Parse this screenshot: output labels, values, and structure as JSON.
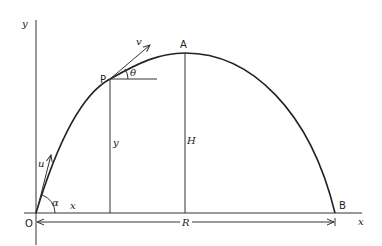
{
  "diagram": {
    "type": "projectile-trajectory",
    "labels": {
      "y_axis": "y",
      "x_axis": "x",
      "origin": "O",
      "apex": "A",
      "landing": "B",
      "point": "P",
      "velocity": "v",
      "angle_at_p": "θ",
      "initial_velocity": "u",
      "launch_angle": "α",
      "horizontal_displacement": "x",
      "vertical_displacement": "y",
      "max_height": "H",
      "range": "R"
    },
    "colors": {
      "line": "#333333",
      "background": "#ffffff"
    }
  }
}
